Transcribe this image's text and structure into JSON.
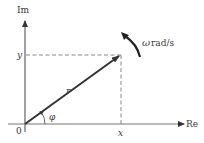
{
  "diagram": {
    "type": "phasor",
    "axes": {
      "vertical_label": "Im",
      "horizontal_label": "Re",
      "origin_label": "0"
    },
    "vector": {
      "magnitude_label": "r",
      "angle_label": "φ",
      "x_projection_label": "x",
      "y_projection_label": "y"
    },
    "rotation": {
      "symbol": "ω",
      "units": "rad/s"
    },
    "colors": {
      "axis": "#555555",
      "vector": "#333333",
      "dashed": "#888888",
      "text": "#3a3a3a"
    }
  }
}
